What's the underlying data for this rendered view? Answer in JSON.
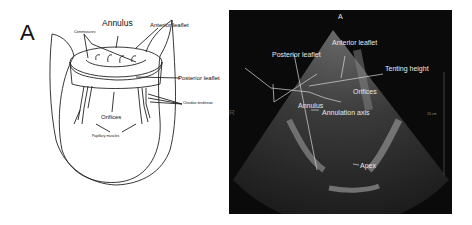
{
  "figure": {
    "panel_letter": "A",
    "diagram": {
      "labels": {
        "annulus": "Annulus",
        "anterior_leaflet": "Anterior leaflet",
        "commissures": "Commissures",
        "posterior_leaflet": "Posterior leaflet",
        "chordae_tendineae": "Chordae tendineae",
        "orifices": "Orifices",
        "papillary_muscles": "Papillary muscles"
      }
    },
    "echo": {
      "orientation_top": "A",
      "orientation_left": "R",
      "scale_label": "15 cm",
      "labels": {
        "anterior_leaflet": "Anterior leaflet",
        "posterior_leaflet": "Posterior leaflet",
        "tenting_height": "Tenting height",
        "orifices": "Orifices",
        "annulus": "Annulus",
        "annulation_axis": "Annulation axis",
        "apex": "Apex"
      },
      "colors": {
        "background": "#0a0a0a",
        "annotation": "#e8e8e8"
      }
    }
  }
}
